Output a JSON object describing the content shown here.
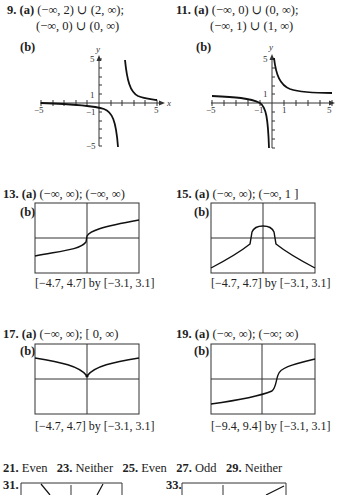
{
  "problems": [
    {
      "num": "9.",
      "a_label": "(a)",
      "a_line1": "(−∞, 2) ∪ (2, ∞);",
      "a_line2": "(−∞, 0) ∪ (0, ∞)",
      "b_label": "(b)"
    },
    {
      "num": "11.",
      "a_label": "(a)",
      "a_line1": "(−∞, 0) ∪ (0, ∞);",
      "a_line2": "(−∞, 1) ∪ (1, ∞)",
      "b_label": "(b)"
    },
    {
      "num": "13.",
      "a_label": "(a)",
      "a_line1": "(−∞, ∞); (−∞, ∞)",
      "b_label": "(b)",
      "window": "[−4.7, 4.7] by [−3.1, 3.1]"
    },
    {
      "num": "15.",
      "a_label": "(a)",
      "a_line1": "(−∞, ∞); (−∞, 1 ]",
      "b_label": "(b)",
      "window": "[−4.7, 4.7] by [−3.1, 3.1]"
    },
    {
      "num": "17.",
      "a_label": "(a)",
      "a_line1": "(−∞, ∞); [ 0, ∞)",
      "b_label": "(b)",
      "window": "[−4.7, 4.7] by [−3.1, 3.1]"
    },
    {
      "num": "19.",
      "a_label": "(a)",
      "a_line1": "(−∞, ∞); (−∞; ∞)",
      "b_label": "(b)",
      "window": "[−9.4, 9.4] by [−3.1, 3.1]"
    }
  ],
  "axis_labels": {
    "g9": {
      "y": "y",
      "x": "x",
      "ytop": "5",
      "yone": "1",
      "yneg1": "−1",
      "ybot": "−5",
      "xleft": "−5",
      "xright": "5"
    },
    "g11": {
      "y": "y",
      "ytop": "5",
      "yone": "1",
      "xneg1": "−1",
      "xone": "1",
      "xleft": "−5",
      "xright": "5"
    }
  },
  "parity": [
    {
      "num": "21.",
      "answer": "Even"
    },
    {
      "num": "23.",
      "answer": "Neither"
    },
    {
      "num": "25.",
      "answer": "Even"
    },
    {
      "num": "27.",
      "answer": "Odd"
    },
    {
      "num": "29.",
      "answer": "Neither"
    }
  ],
  "bottom": [
    {
      "num": "31."
    },
    {
      "num": "33."
    }
  ]
}
